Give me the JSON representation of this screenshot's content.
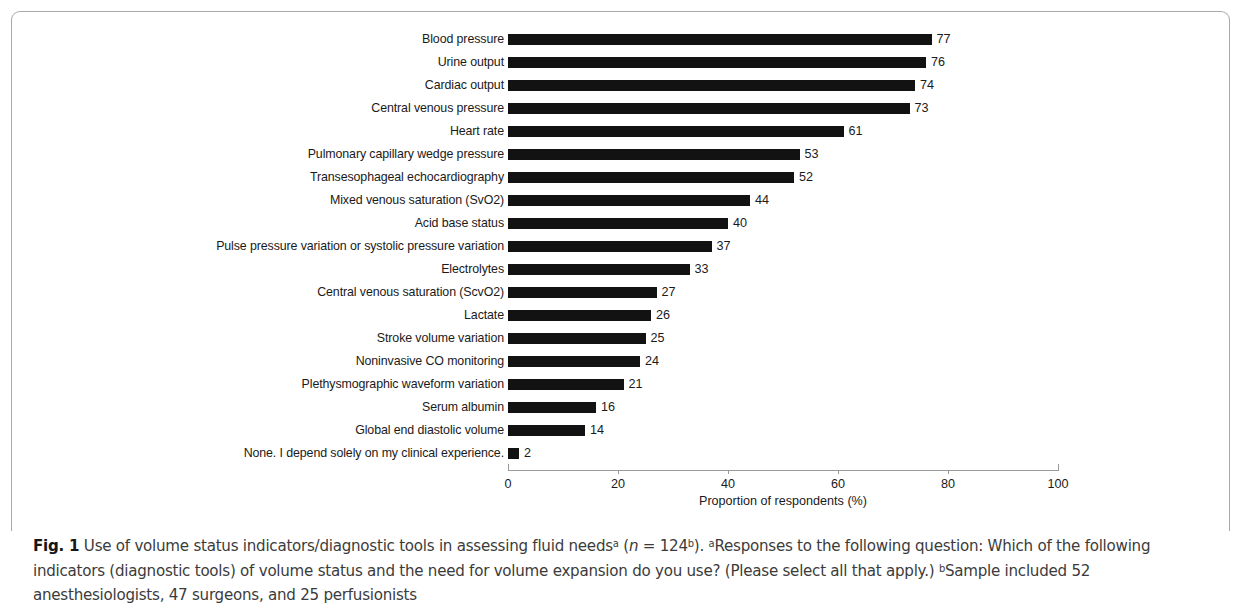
{
  "figure": {
    "frame_color": "#a9a9a9",
    "bar_color": "#121212",
    "axis_color": "#9a9a9a"
  },
  "caption": {
    "fig_label": "Fig. 1",
    "part1": " Use of volume status indicators/diagnostic tools in assessing fluid needs",
    "sup_a1": "a",
    "paren_open": " (",
    "n_italic": "n",
    "n_value": " = 124",
    "sup_b1": "b",
    "paren_close": "). ",
    "sup_a2": "a",
    "part2": "Responses to the following question: Which of the following indicators (diagnostic tools) of volume status and the need for volume expansion do you use? (Please select all that apply.) ",
    "sup_b2": "b",
    "part3": "Sample included 52 anesthesiologists, 47 surgeons, and 25 perfusionists"
  },
  "chart_data": {
    "type": "bar",
    "orientation": "horizontal",
    "title": "",
    "xlabel": "Proportion of respondents (%)",
    "ylabel": "",
    "xlim": [
      0,
      100
    ],
    "xticks": [
      0,
      20,
      40,
      60,
      80,
      100
    ],
    "xtick_labels": [
      "0",
      "20",
      "40",
      "60",
      "80",
      "100"
    ],
    "grid": false,
    "legend": false,
    "show_value_labels": true,
    "categories": [
      "Blood pressure",
      "Urine output",
      "Cardiac output",
      "Central venous pressure",
      "Heart rate",
      "Pulmonary capillary wedge pressure",
      "Transesophageal echocardiography",
      "Mixed venous saturation (SvO2)",
      "Acid base status",
      "Pulse pressure variation or systolic pressure variation",
      "Electrolytes",
      "Central venous saturation (ScvO2)",
      "Lactate",
      "Stroke volume variation",
      "Noninvasive CO monitoring",
      "Plethysmographic waveform variation",
      "Serum albumin",
      "Global end diastolic volume",
      "None.  I depend solely on my clinical experience."
    ],
    "values": [
      77,
      76,
      74,
      73,
      61,
      53,
      52,
      44,
      40,
      37,
      33,
      27,
      26,
      25,
      24,
      21,
      16,
      14,
      2
    ],
    "value_labels": [
      "77",
      "76",
      "74",
      "73",
      "61",
      "53",
      "52",
      "44",
      "40",
      "37",
      "33",
      "27",
      "26",
      "25",
      "24",
      "21",
      "16",
      "14",
      "2"
    ]
  }
}
